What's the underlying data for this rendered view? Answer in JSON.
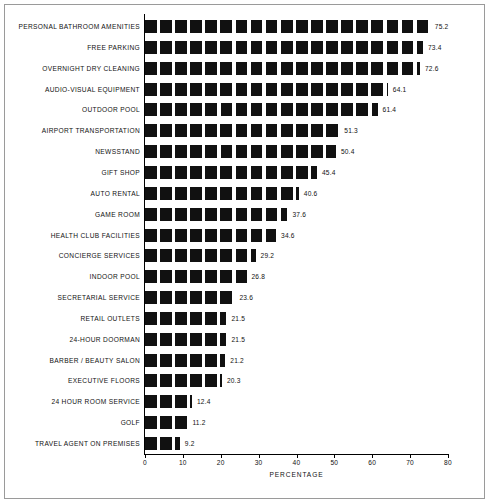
{
  "chart_data": {
    "type": "bar",
    "orientation": "horizontal",
    "title": "",
    "xlabel": "PERCENTAGE",
    "ylabel": "",
    "xlim": [
      0,
      80
    ],
    "xticks": [
      0,
      10,
      20,
      30,
      40,
      50,
      60,
      70,
      80
    ],
    "grid": false,
    "legend": null,
    "categories": [
      "PERSONAL BATHROOM AMENITIES",
      "FREE PARKING",
      "OVERNIGHT DRY CLEANING",
      "AUDIO-VISUAL EQUIPMENT",
      "OUTDOOR POOL",
      "AIRPORT TRANSPORTATION",
      "NEWSSTAND",
      "GIFT SHOP",
      "AUTO RENTAL",
      "GAME ROOM",
      "HEALTH CLUB FACILITIES",
      "CONCIERGE SERVICES",
      "INDOOR POOL",
      "SECRETARIAL SERVICE",
      "RETAIL OUTLETS",
      "24-HOUR DOORMAN",
      "BARBER / BEAUTY SALON",
      "EXECUTIVE FLOORS",
      "24 HOUR ROOM SERVICE",
      "GOLF",
      "TRAVEL AGENT ON PREMISES"
    ],
    "values": [
      75.2,
      73.4,
      72.6,
      64.1,
      61.4,
      51.3,
      50.4,
      45.4,
      40.6,
      37.6,
      34.6,
      29.2,
      26.8,
      23.6,
      21.5,
      21.5,
      21.2,
      20.3,
      12.4,
      11.2,
      9.2
    ],
    "value_labels": [
      "75.2",
      "73.4",
      "72.6",
      "64.1",
      "61.4",
      "51.3",
      "50.4",
      "45.4",
      "40.6",
      "37.6",
      "34.6",
      "29.2",
      "26.8",
      "23.6",
      "21.5",
      "21.5",
      "21.2",
      "20.3",
      "12.4",
      "11.2",
      "9.2"
    ],
    "xtick_labels": [
      "0",
      "10",
      "20",
      "30",
      "40",
      "50",
      "60",
      "70",
      "80"
    ],
    "bar_color": "#111111",
    "background_color": "#ffffff",
    "axis_color": "#000000",
    "bar_fill_style": "segmented-blocks"
  }
}
